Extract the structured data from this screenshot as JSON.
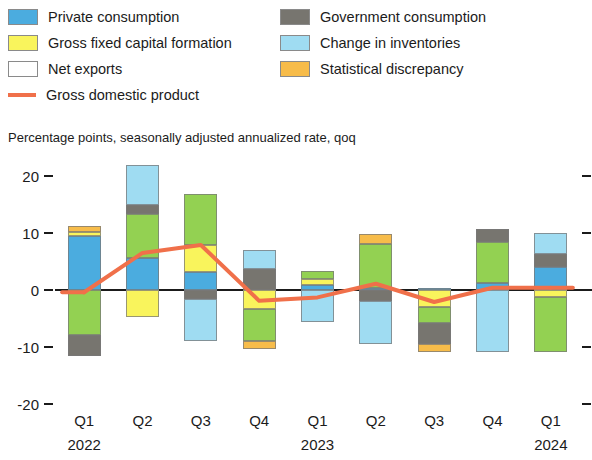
{
  "legend": {
    "left_column": [
      {
        "label": "Private consumption",
        "color": "#4bacdf",
        "type": "swatch",
        "key": "private_consumption"
      },
      {
        "label": "Gross fixed capital formation",
        "color": "#f9f45c",
        "type": "swatch",
        "key": "gross_fixed_capital_formation"
      },
      {
        "label": "Net exports",
        "color": "#9ad martin",
        "type": "swatch",
        "key": "net_exports"
      },
      {
        "label": "Gross domestic product",
        "color": "#f0704a",
        "type": "line",
        "key": "gdp"
      }
    ],
    "right_column": [
      {
        "label": "Government consumption",
        "color": "#77756f",
        "type": "swatch",
        "key": "government_consumption"
      },
      {
        "label": "Change in inventories",
        "color": "#9fdcf2",
        "type": "swatch",
        "key": "change_in_inventories"
      },
      {
        "label": "Statistical discrepancy",
        "color": "#f7bc4a",
        "type": "swatch",
        "key": "statistical_discrepancy"
      }
    ]
  },
  "units_note": "Percentage points, seasonally adjusted annualized rate, qoq",
  "axis": {
    "y_ticks": [
      "20",
      "10",
      "0",
      "-10",
      "-20"
    ],
    "x_quarters": [
      "Q1",
      "Q2",
      "Q3",
      "Q4",
      "Q1",
      "Q2",
      "Q3",
      "Q4",
      "Q1"
    ],
    "x_years": [
      {
        "label": "2022",
        "at_index": 0
      },
      {
        "label": "2023",
        "at_index": 4
      },
      {
        "label": "2024",
        "at_index": 8
      }
    ]
  },
  "chart_data": {
    "type": "bar",
    "title": "",
    "subtitle": "Percentage points, seasonally adjusted annualized rate, qoq",
    "xlabel": "",
    "ylabel": "Percentage points",
    "ylim": [
      -20,
      20
    ],
    "yticks": [
      -20,
      -10,
      0,
      10,
      20
    ],
    "grid": false,
    "legend_position": "top",
    "stacked": true,
    "categories": [
      "Q1 2022",
      "Q2 2022",
      "Q3 2022",
      "Q4 2022",
      "Q1 2023",
      "Q2 2023",
      "Q3 2023",
      "Q4 2023",
      "Q1 2024"
    ],
    "series": [
      {
        "name": "Private consumption",
        "color": "#4bacdf",
        "values": [
          9.5,
          5.6,
          3.2,
          0.0,
          0.9,
          0.4,
          0.4,
          1.3,
          4.0
        ]
      },
      {
        "name": "Gross fixed capital formation",
        "color": "#f9f45c",
        "values": [
          0.6,
          -4.7,
          4.7,
          -3.4,
          1.1,
          0.0,
          -3.0,
          0.0,
          -1.3
        ]
      },
      {
        "name": "Net exports",
        "color": "#93d152",
        "values": [
          -7.9,
          7.7,
          9.0,
          -5.6,
          1.3,
          7.7,
          -2.8,
          7.1,
          -9.5
        ]
      },
      {
        "name": "Government consumption",
        "color": "#77756f",
        "values": [
          -3.7,
          1.7,
          -1.5,
          3.7,
          0.0,
          -1.9,
          -3.7,
          2.3,
          2.4
        ]
      },
      {
        "name": "Change in inventories",
        "color": "#9fdcf2",
        "values": [
          0.0,
          6.9,
          -7.5,
          3.4,
          -5.6,
          -7.5,
          0.0,
          -10.9,
          3.6
        ]
      },
      {
        "name": "Statistical discrepancy",
        "color": "#f7bc4a",
        "values": [
          1.1,
          0.0,
          0.0,
          -1.3,
          0.0,
          1.7,
          -1.3,
          0.0,
          0.0
        ]
      }
    ],
    "line_series": {
      "name": "Gross domestic product",
      "color": "#f0704a",
      "values": [
        -0.4,
        6.5,
        7.9,
        -1.9,
        -1.3,
        1.1,
        -2.1,
        0.4,
        0.4
      ]
    }
  }
}
